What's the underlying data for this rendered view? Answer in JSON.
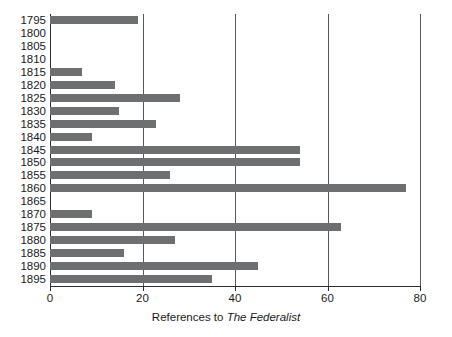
{
  "chart_data": {
    "type": "bar",
    "orientation": "horizontal",
    "title": "",
    "xlabel_prefix": "References to ",
    "xlabel_italic": "The Federalist",
    "xlabel": "References to The Federalist",
    "ylabel": "",
    "xlim": [
      0,
      80
    ],
    "xticks": [
      0,
      20,
      40,
      60,
      80
    ],
    "xtick_labels": [
      "0",
      "20",
      "40",
      "60",
      "80"
    ],
    "grid": "vertical",
    "legend": "none",
    "bar_color": "#6d6f71",
    "axis_color": "#2a2d2f",
    "gridline_color": "#55595c",
    "categories": [
      "1795",
      "1800",
      "1805",
      "1810",
      "1815",
      "1820",
      "1825",
      "1830",
      "1835",
      "1840",
      "1845",
      "1850",
      "1855",
      "1860",
      "1865",
      "1870",
      "1875",
      "1880",
      "1885",
      "1890",
      "1895"
    ],
    "values": [
      19,
      0,
      0,
      0,
      7,
      14,
      28,
      15,
      23,
      9,
      54,
      54,
      26,
      77,
      0,
      9,
      63,
      27,
      16,
      45,
      35
    ]
  }
}
